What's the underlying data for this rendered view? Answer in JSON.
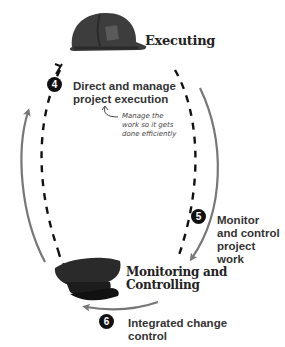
{
  "phases": {
    "executing": {
      "label": "Executing",
      "icon": "hard-hat-icon"
    },
    "monitoring": {
      "line1": "Monitoring and",
      "line2": "Controlling",
      "icon": "officer-cap-icon"
    }
  },
  "steps": [
    {
      "number": "4",
      "line1": "Direct and manage",
      "line2": "project execution"
    },
    {
      "number": "5",
      "line1": "Monitor",
      "line2": "and control",
      "line3": "project",
      "line4": "work"
    },
    {
      "number": "6",
      "line1": "Integrated change",
      "line2": "control"
    }
  ],
  "note": {
    "line1": "Manage the",
    "line2": "work so it gets",
    "line3": "done efficiently"
  },
  "colors": {
    "dashed": "#111111",
    "arrow": "#777777",
    "badge": "#111111",
    "hat": "#3d3d3d"
  }
}
